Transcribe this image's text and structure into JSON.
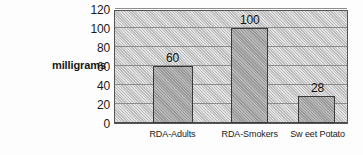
{
  "chart_data": {
    "type": "bar",
    "title": "",
    "subtitle": "",
    "xlabel": "",
    "ylabel": "milligrams",
    "categories": [
      "RDA-Adults",
      "RDA-Smokers",
      "Sw eet Potato"
    ],
    "values": [
      60,
      100,
      28
    ],
    "data_labels": [
      "60",
      "100",
      "28"
    ],
    "ylim": [
      0,
      120
    ],
    "ytick_values": [
      0,
      20,
      40,
      60,
      80,
      100,
      120
    ],
    "ytick_labels": [
      "0",
      "20",
      "40",
      "60",
      "80",
      "100",
      "120"
    ],
    "grid": true,
    "grid_axis": "y",
    "legend": false,
    "legend_position": "none",
    "orientation": "vertical",
    "colors": {
      "bar_fill": "#9a9a9a",
      "bar_border": "#3a3a3a",
      "plot_background": "#bdbdbd",
      "plot_border": "#555555",
      "gridline": "#8c8c8c",
      "baseline": "#4a4a4a",
      "text": "#1a1a1a",
      "figure_background": "#fdfdfd"
    },
    "bar_geometry": [
      {
        "center_pct": 25.0,
        "width_pct": 17.0
      },
      {
        "center_pct": 58.0,
        "width_pct": 16.0
      },
      {
        "center_pct": 87.0,
        "width_pct": 16.0
      }
    ]
  }
}
